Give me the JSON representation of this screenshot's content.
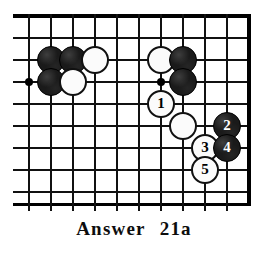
{
  "figure": {
    "kind": "go-board-diagram",
    "caption_label": "Answer",
    "caption_number": "21a",
    "caption_full": "Answer   21a"
  },
  "board": {
    "type": "go",
    "view": "top-right corner section",
    "columns": 10,
    "rows": 9,
    "cell_size_px": 22,
    "origin_x_px": 29,
    "origin_y_px": 16,
    "line_color": "#111111",
    "border_color": "#000000",
    "background_color": "#ffffff",
    "edges": {
      "top": "board-edge",
      "right": "board-edge",
      "bottom": "open",
      "left": "open"
    },
    "star_points": [
      {
        "col": 0,
        "row": 3
      },
      {
        "col": 6,
        "row": 3
      }
    ],
    "stones": [
      {
        "id": "b-c1r2",
        "color": "black",
        "col": 1,
        "row": 2,
        "label": ""
      },
      {
        "id": "b-c2r2",
        "color": "black",
        "col": 2,
        "row": 2,
        "label": ""
      },
      {
        "id": "w-c3r2",
        "color": "white",
        "col": 3,
        "row": 2,
        "label": ""
      },
      {
        "id": "b-c1r3",
        "color": "black",
        "col": 1,
        "row": 3,
        "label": ""
      },
      {
        "id": "w-c2r3",
        "color": "white",
        "col": 2,
        "row": 3,
        "label": ""
      },
      {
        "id": "w-c6r2",
        "color": "white",
        "col": 6,
        "row": 2,
        "label": ""
      },
      {
        "id": "b-c7r2",
        "color": "black",
        "col": 7,
        "row": 2,
        "label": ""
      },
      {
        "id": "b-c7r3",
        "color": "black",
        "col": 7,
        "row": 3,
        "label": ""
      },
      {
        "id": "w-move-1",
        "color": "white",
        "col": 6,
        "row": 4,
        "label": "1"
      },
      {
        "id": "w-c7r5",
        "color": "white",
        "col": 7,
        "row": 5,
        "label": ""
      },
      {
        "id": "b-move-2",
        "color": "black",
        "col": 9,
        "row": 5,
        "label": "2"
      },
      {
        "id": "w-move-3",
        "color": "white",
        "col": 8,
        "row": 6,
        "label": "3"
      },
      {
        "id": "b-move-4",
        "color": "black",
        "col": 9,
        "row": 6,
        "label": "4"
      },
      {
        "id": "w-move-5",
        "color": "white",
        "col": 8,
        "row": 7,
        "label": "5"
      }
    ],
    "move_sequence": [
      {
        "number": "1",
        "color": "white"
      },
      {
        "number": "2",
        "color": "black"
      },
      {
        "number": "3",
        "color": "white"
      },
      {
        "number": "4",
        "color": "black"
      },
      {
        "number": "5",
        "color": "white"
      }
    ]
  }
}
